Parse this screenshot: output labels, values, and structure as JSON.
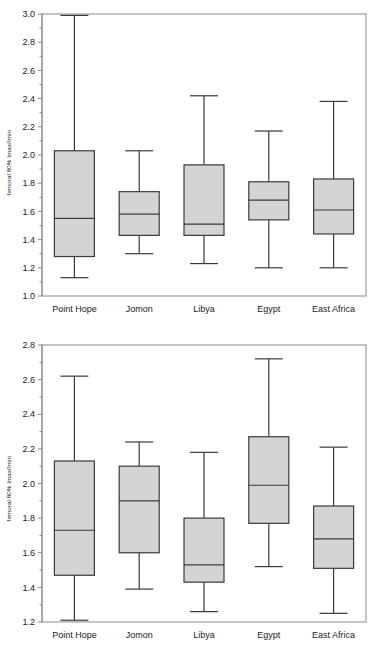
{
  "figure": {
    "width": 373,
    "height": 652,
    "background": "#ffffff",
    "box_fill": "#d4d4d4",
    "box_stroke": "#3a3a3a",
    "axis_color": "#8a8a8a"
  },
  "panels": [
    {
      "id": "chart-top",
      "ylabel": "femoral 80% Imax/Imin",
      "ylim": [
        1.0,
        3.0
      ],
      "yticks": [
        1.0,
        1.2,
        1.4,
        1.6,
        1.8,
        2.0,
        2.2,
        2.4,
        2.6,
        2.8,
        3.0
      ],
      "ytick_labels": [
        "1.0",
        "1.2",
        "1.4",
        "1.6",
        "1.8",
        "2.0",
        "2.2",
        "2.4",
        "2.6",
        "2.8",
        "3.0"
      ],
      "minor_ticks": true
    },
    {
      "id": "chart-bottom",
      "ylabel": "femoral 80% Imax/Imin",
      "ylim": [
        1.2,
        2.8
      ],
      "yticks": [
        1.2,
        1.4,
        1.6,
        1.8,
        2.0,
        2.2,
        2.4,
        2.6,
        2.8
      ],
      "ytick_labels": [
        "1.2",
        "1.4",
        "1.6",
        "1.8",
        "2.0",
        "2.2",
        "2.4",
        "2.6",
        "2.8"
      ],
      "minor_ticks": true
    }
  ],
  "chart_data": [
    {
      "type": "box",
      "panel": "top",
      "title": "",
      "xlabel": "",
      "ylabel": "femoral 80% Imax/Imin",
      "ylim": [
        1.0,
        3.0
      ],
      "yticks": [
        1.0,
        1.2,
        1.4,
        1.6,
        1.8,
        2.0,
        2.2,
        2.4,
        2.6,
        2.8,
        3.0
      ],
      "grid": false,
      "legend": "none",
      "categories": [
        "Point Hope",
        "Jomon",
        "Libya",
        "Egypt",
        "East Africa"
      ],
      "boxes": [
        {
          "category": "Point Hope",
          "whisker_low": 1.13,
          "q1": 1.28,
          "median": 1.55,
          "q3": 2.03,
          "whisker_high": 2.99
        },
        {
          "category": "Jomon",
          "whisker_low": 1.3,
          "q1": 1.43,
          "median": 1.58,
          "q3": 1.74,
          "whisker_high": 2.03
        },
        {
          "category": "Libya",
          "whisker_low": 1.23,
          "q1": 1.43,
          "median": 1.51,
          "q3": 1.93,
          "whisker_high": 2.42
        },
        {
          "category": "Egypt",
          "whisker_low": 1.2,
          "q1": 1.54,
          "median": 1.68,
          "q3": 1.81,
          "whisker_high": 2.17
        },
        {
          "category": "East Africa",
          "whisker_low": 1.2,
          "q1": 1.44,
          "median": 1.61,
          "q3": 1.83,
          "whisker_high": 2.38
        }
      ]
    },
    {
      "type": "box",
      "panel": "bottom",
      "title": "",
      "xlabel": "",
      "ylabel": "femoral 80% Imax/Imin",
      "ylim": [
        1.2,
        2.8
      ],
      "yticks": [
        1.2,
        1.4,
        1.6,
        1.8,
        2.0,
        2.2,
        2.4,
        2.6,
        2.8
      ],
      "grid": false,
      "legend": "none",
      "categories": [
        "Point Hope",
        "Jomon",
        "Libya",
        "Egypt",
        "East Africa"
      ],
      "boxes": [
        {
          "category": "Point Hope",
          "whisker_low": 1.21,
          "q1": 1.47,
          "median": 1.73,
          "q3": 2.13,
          "whisker_high": 2.62
        },
        {
          "category": "Jomon",
          "whisker_low": 1.39,
          "q1": 1.6,
          "median": 1.9,
          "q3": 2.1,
          "whisker_high": 2.24
        },
        {
          "category": "Libya",
          "whisker_low": 1.26,
          "q1": 1.43,
          "median": 1.53,
          "q3": 1.8,
          "whisker_high": 2.18
        },
        {
          "category": "Egypt",
          "whisker_low": 1.52,
          "q1": 1.77,
          "median": 1.99,
          "q3": 2.27,
          "whisker_high": 2.72
        },
        {
          "category": "East Africa",
          "whisker_low": 1.25,
          "q1": 1.51,
          "median": 1.68,
          "q3": 1.87,
          "whisker_high": 2.21
        }
      ]
    }
  ]
}
